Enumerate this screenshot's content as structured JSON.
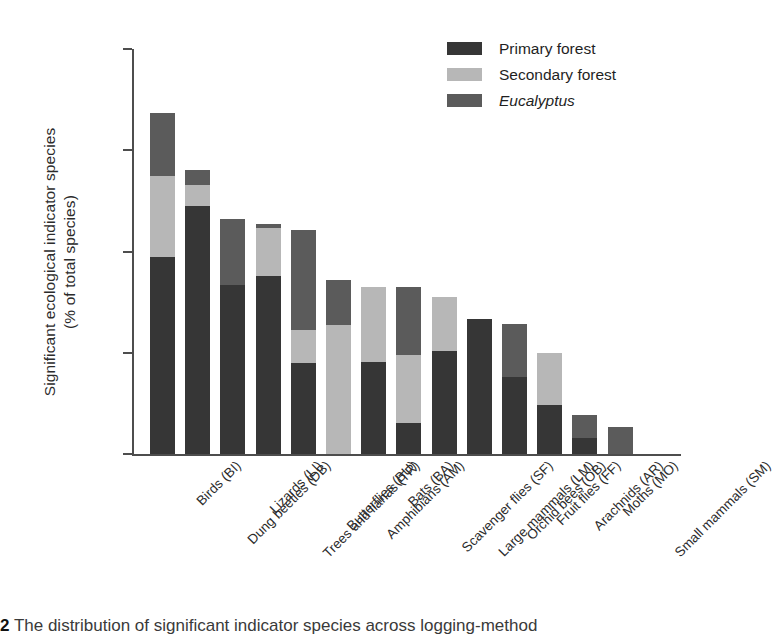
{
  "figure": {
    "ylabel_line1": "Significant ecological indicator species",
    "ylabel_line2": "(% of total species)",
    "caption_number": "2",
    "caption_text": "The distribution of significant indicator species across logging-method"
  },
  "legend": {
    "items": [
      {
        "label": "Primary forest",
        "color": "#363636",
        "italic": false
      },
      {
        "label": "Secondary forest",
        "color": "#b7b7b7",
        "italic": false
      },
      {
        "label": "Eucalyptus",
        "color": "#5b5b5b",
        "italic": true
      }
    ]
  },
  "axis": {
    "yticks": [
      "0",
      "10",
      "20",
      "30",
      "40"
    ]
  },
  "chart_data": {
    "type": "bar",
    "subtype": "stacked-vertical",
    "title": "",
    "xlabel": "",
    "ylabel": "Significant ecological indicator species (% of total species)",
    "ylim": [
      0,
      40
    ],
    "ytick_values": [
      0,
      10,
      20,
      30,
      40
    ],
    "grid": false,
    "legend_position": "top-right",
    "categories": [
      "Birds (BI)",
      "Dung beetles (DB)",
      "Lizards (LI)",
      "Trees and lianas (TR)",
      "Butterflies (BU)",
      "Amphibians (AM)",
      "Bats (BA)",
      "Scavenger flies (SF)",
      "Large mammals (LM)",
      "Orchid bees (OB)",
      "Fruit flies (FF)",
      "Arachnids (AR)",
      "Moths (MO)",
      "Small mammals (SM)"
    ],
    "series": [
      {
        "name": "Primary forest",
        "color": "#363636",
        "values": [
          19.5,
          24.5,
          16.7,
          17.6,
          9.0,
          0.0,
          9.1,
          3.1,
          10.2,
          13.3,
          7.6,
          4.8,
          1.6,
          0.0
        ]
      },
      {
        "name": "Secondary forest",
        "color": "#b7b7b7",
        "values": [
          8.0,
          2.1,
          0.0,
          4.7,
          3.2,
          12.7,
          7.4,
          6.7,
          5.3,
          0.0,
          0.0,
          5.2,
          0.0,
          0.0
        ]
      },
      {
        "name": "Eucalyptus",
        "color": "#5b5b5b",
        "values": [
          6.2,
          1.5,
          6.5,
          0.4,
          9.9,
          4.5,
          0.0,
          6.7,
          0.0,
          0.0,
          5.2,
          0.0,
          2.3,
          2.7
        ]
      }
    ],
    "totals": [
      33.7,
      28.1,
      23.2,
      22.7,
      22.1,
      17.2,
      16.5,
      16.5,
      15.5,
      13.3,
      12.8,
      10.0,
      3.9,
      2.7
    ]
  }
}
